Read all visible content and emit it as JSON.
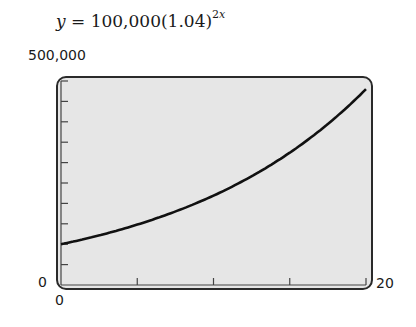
{
  "chart_data": {
    "type": "line",
    "title_parts": {
      "lhs": "y",
      "eq": " = ",
      "base": "100,000(1.04)",
      "exponent_coef": "2",
      "exponent_var": "x"
    },
    "function": "100000*Math.pow(1.04, 2*x)",
    "x": [
      0,
      2,
      4,
      6,
      8,
      10,
      12,
      14,
      16,
      18,
      20
    ],
    "values": [
      100000,
      116986,
      136857,
      160103,
      187298,
      219112,
      256330,
      299870,
      350806,
      410393,
      480102
    ],
    "xlim": [
      0,
      20
    ],
    "ylim": [
      0,
      500000
    ],
    "xticks": [
      0,
      5,
      10,
      15,
      20
    ],
    "yticks": [
      0,
      50000,
      100000,
      150000,
      200000,
      250000,
      300000,
      350000,
      400000,
      450000,
      500000
    ],
    "xlabel": "",
    "ylabel": "",
    "tick_labels": {
      "ymax": "500,000",
      "ymin": "0",
      "xmin": "0",
      "xmax": "20"
    },
    "grid": false,
    "legend": null,
    "colors": {
      "background": "#e6e6e6",
      "frame": "#2a2a2a",
      "curve": "#111111"
    }
  }
}
